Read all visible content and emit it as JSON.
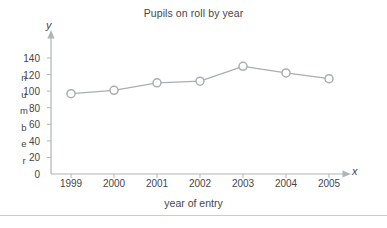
{
  "chart_data": {
    "type": "line",
    "title": "Pupils on roll by year",
    "xlabel": "year of entry",
    "ylabel": "number",
    "axis_letter_y": "y",
    "axis_letter_x": "x",
    "categories": [
      "1999",
      "2000",
      "2001",
      "2002",
      "2003",
      "2004",
      "2005"
    ],
    "values": [
      97,
      101,
      110,
      112,
      130,
      122,
      115
    ],
    "ylim": [
      0,
      150
    ],
    "yticks": [
      140,
      120,
      100,
      80,
      60,
      40,
      20,
      0
    ],
    "ytick_labels": [
      "140",
      "120",
      "100",
      "80",
      "60",
      "40",
      "20",
      "0"
    ],
    "ylabel_letters": [
      "n",
      "u",
      "m",
      "b",
      "e",
      "r"
    ],
    "grid": false,
    "legend": null,
    "marker": "open-circle",
    "colors": {
      "line": "#a9aeb4",
      "marker_stroke": "#a9aeb4",
      "marker_fill": "#ffffff",
      "axis": "#b0b4b9",
      "text": "#46464a",
      "rule": "#c9ccd1"
    }
  }
}
